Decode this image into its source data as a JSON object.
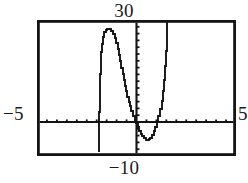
{
  "screen": {
    "width": 248,
    "height": 183,
    "background": "#ffffff",
    "ink": "#141414"
  },
  "labels": {
    "top": "30",
    "bottom": "−10",
    "left": "−5",
    "right": "5"
  },
  "chart_data": {
    "type": "line",
    "title": "",
    "subtitle": "",
    "xlabel": "",
    "ylabel": "",
    "xlim": [
      -5,
      5
    ],
    "ylim": [
      -10,
      30
    ],
    "grid": false,
    "legend": null,
    "legend_position": "none",
    "axes": {
      "x_axis_y_value": 0,
      "y_axis_x_value": 0,
      "x_tick_step": 0.5,
      "y_tick_step": 2,
      "x_ticks": [
        -4.5,
        -4,
        -3.5,
        -3,
        -2.5,
        -2,
        -1.5,
        -1,
        -0.5,
        0.5,
        1,
        1.5,
        2,
        2.5,
        3,
        3.5,
        4,
        4.5
      ],
      "y_ticks": [
        -8,
        -6,
        -4,
        -2,
        2,
        4,
        6,
        8,
        10,
        12,
        14,
        16,
        18,
        20,
        22,
        24,
        26,
        28
      ],
      "frame": true,
      "tick_marks": true
    },
    "annotations": [
      {
        "text": "30",
        "position": "top-outside-center",
        "meaning": "y-axis maximum"
      },
      {
        "text": "−10",
        "position": "bottom-outside-center",
        "meaning": "y-axis minimum"
      },
      {
        "text": "−5",
        "position": "left-outside-middle",
        "meaning": "x-axis minimum"
      },
      {
        "text": "5",
        "position": "right-outside-middle",
        "meaning": "x-axis maximum"
      }
    ],
    "features": {
      "vertical_asymptotes": [
        -1.75,
        1.55
      ],
      "local_maximum": {
        "x": -1.1,
        "y": 27.5
      },
      "local_minimum": {
        "x": 0.55,
        "y": -5.3
      },
      "x_intercepts": [
        -1.9,
        0.1,
        1.25
      ],
      "description": "Steeply varying rational / tangent-like curve with two vertical asymptote branches drawn as near-vertical segments, a rounded peak near the top of the window on the left, a steep descent crossing the y-axis, a rounded valley below the x-axis, then a steep rise off the top of the window on the right."
    },
    "series": [
      {
        "name": "curve",
        "color": "#141414",
        "x": [
          -1.87,
          -1.87,
          -1.86,
          -1.85,
          -1.84,
          -1.83,
          -1.8,
          -1.76,
          -1.72,
          -1.68,
          -1.62,
          -1.55,
          -1.47,
          -1.38,
          -1.28,
          -1.18,
          -1.1,
          -1.02,
          -0.95,
          -0.88,
          -0.82,
          -0.76,
          -0.7,
          -0.64,
          -0.58,
          -0.52,
          -0.46,
          -0.4,
          -0.33,
          -0.26,
          -0.18,
          -0.1,
          -0.02,
          0.06,
          0.14,
          0.22,
          0.3,
          0.38,
          0.46,
          0.54,
          0.62,
          0.7,
          0.78,
          0.86,
          0.94,
          1.02,
          1.1,
          1.18,
          1.26,
          1.34,
          1.4,
          1.45,
          1.49,
          1.52,
          1.54,
          1.55,
          1.56
        ],
        "y": [
          -8.8,
          -4.0,
          0.0,
          3.0,
          6.5,
          10.0,
          14.0,
          17.5,
          20.5,
          23.0,
          25.0,
          26.4,
          27.2,
          27.5,
          27.4,
          26.8,
          26.0,
          24.8,
          23.3,
          21.6,
          19.8,
          17.9,
          16.0,
          14.1,
          12.3,
          10.6,
          9.0,
          7.5,
          6.0,
          4.6,
          3.2,
          1.9,
          0.7,
          -0.4,
          -1.5,
          -2.5,
          -3.4,
          -4.1,
          -4.7,
          -5.2,
          -5.3,
          -5.1,
          -4.6,
          -3.8,
          -2.7,
          -1.4,
          0.1,
          1.8,
          3.8,
          6.2,
          9.0,
          12.5,
          16.5,
          21.0,
          25.0,
          28.0,
          30.0
        ]
      }
    ]
  },
  "geometry": {
    "frame": {
      "left": 37,
      "top": 20,
      "width": 199,
      "height": 136
    },
    "x_axis_pixel_y": 97,
    "y_axis_pixel_x": 100
  }
}
